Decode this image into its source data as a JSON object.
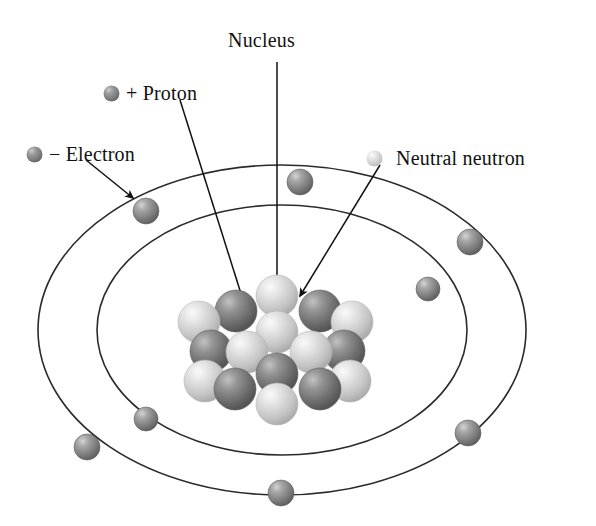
{
  "diagram": {
    "background": "#ffffff",
    "stroke_color": "#2b2b2b",
    "label_color": "#111111"
  },
  "labels": {
    "nucleus": "Nucleus",
    "proton": "+ Proton",
    "electron": "− Electron",
    "neutron": "Neutral neutron"
  },
  "legend": [
    {
      "key": "proton",
      "text": "+ Proton",
      "marker": "proton-sphere",
      "color": "#8c8c8c",
      "x": 110,
      "y": 83,
      "r": 8
    },
    {
      "key": "electron",
      "text": "− Electron",
      "marker": "electron-sphere",
      "color": "#8c8c8c",
      "x": 33,
      "y": 145,
      "r": 8
    },
    {
      "key": "neutron",
      "text": "Neutral neutron",
      "marker": "neutron-sphere",
      "color": "#d2d2d2",
      "x": 372,
      "y": 150,
      "r": 8
    }
  ],
  "colors": {
    "proton": "#7f7f7f",
    "proton_dark": "#4f4f4f",
    "proton_light": "#b4b4b4",
    "neutron": "#d6d6d6",
    "neutron_dark": "#a8a8a8",
    "neutron_light": "#f2f2f2",
    "electron": "#8f8f8f",
    "electron_dark": "#5a5a5a",
    "electron_light": "#c8c8c8",
    "orbit_line": "#2b2b2b"
  },
  "orbits": [
    {
      "name": "outer-orbit",
      "cx": 282,
      "cy": 330,
      "rx": 244,
      "ry": 165
    },
    {
      "name": "inner-orbit",
      "cx": 282,
      "cy": 330,
      "rx": 185,
      "ry": 125
    }
  ],
  "electrons": [
    {
      "id": 1,
      "orbit": "outer",
      "x": 146,
      "y": 211,
      "r": 13
    },
    {
      "id": 2,
      "orbit": "outer",
      "x": 300,
      "y": 182,
      "r": 13
    },
    {
      "id": 3,
      "orbit": "outer",
      "x": 470,
      "y": 242,
      "r": 13
    },
    {
      "id": 4,
      "orbit": "outer",
      "x": 468,
      "y": 433,
      "r": 13
    },
    {
      "id": 5,
      "orbit": "outer",
      "x": 281,
      "y": 493,
      "r": 13
    },
    {
      "id": 6,
      "orbit": "outer",
      "x": 87,
      "y": 447,
      "r": 13
    },
    {
      "id": 7,
      "orbit": "inner",
      "x": 428,
      "y": 289,
      "r": 12
    },
    {
      "id": 8,
      "orbit": "inner",
      "x": 146,
      "y": 419,
      "r": 12
    }
  ],
  "nucleus": {
    "center_x": 277,
    "center_y": 344,
    "particle_radius": 21,
    "particles": [
      {
        "type": "neutron",
        "x": 277,
        "y": 296
      },
      {
        "type": "proton",
        "x": 236,
        "y": 311
      },
      {
        "type": "proton",
        "x": 320,
        "y": 311
      },
      {
        "type": "neutron",
        "x": 199,
        "y": 322
      },
      {
        "type": "neutron",
        "x": 352,
        "y": 322
      },
      {
        "type": "neutron",
        "x": 277,
        "y": 332
      },
      {
        "type": "proton",
        "x": 211,
        "y": 351
      },
      {
        "type": "proton",
        "x": 344,
        "y": 351
      },
      {
        "type": "neutron",
        "x": 247,
        "y": 352
      },
      {
        "type": "neutron",
        "x": 311,
        "y": 352
      },
      {
        "type": "proton",
        "x": 277,
        "y": 374
      },
      {
        "type": "neutron",
        "x": 205,
        "y": 381
      },
      {
        "type": "neutron",
        "x": 350,
        "y": 381
      },
      {
        "type": "proton",
        "x": 235,
        "y": 389
      },
      {
        "type": "proton",
        "x": 320,
        "y": 389
      },
      {
        "type": "neutron",
        "x": 277,
        "y": 404
      }
    ]
  },
  "pointers": [
    {
      "name": "nucleus-pointer",
      "from_x": 277,
      "from_y": 62,
      "to_x": 277,
      "to_y": 298,
      "arrow": true
    },
    {
      "name": "proton-pointer",
      "from_x": 180,
      "from_y": 100,
      "to_x": 243,
      "to_y": 300,
      "arrow": true
    },
    {
      "name": "electron-pointer",
      "from_x": 86,
      "from_y": 160,
      "to_x": 133,
      "to_y": 198,
      "arrow": true
    },
    {
      "name": "neutron-pointer",
      "from_x": 380,
      "from_y": 165,
      "to_x": 300,
      "to_y": 296,
      "arrow": true
    }
  ]
}
